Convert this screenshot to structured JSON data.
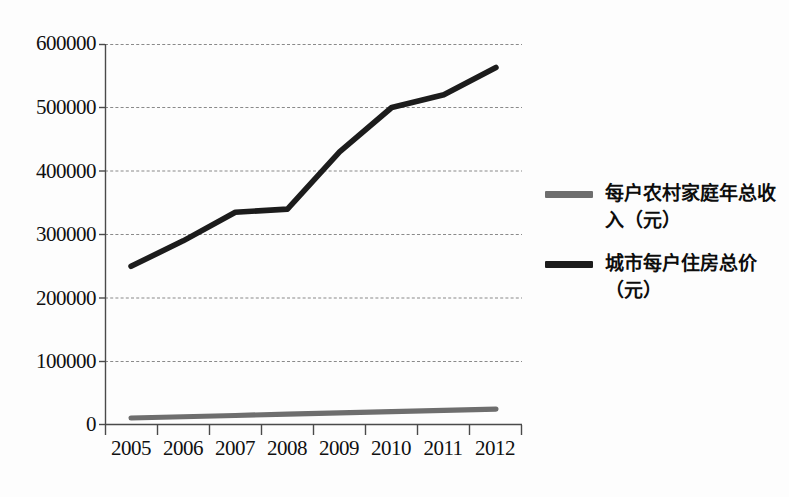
{
  "chart_data": {
    "type": "line",
    "title": "",
    "subtitle": "",
    "xlabel": "",
    "ylabel": "",
    "categories": [
      "2005",
      "2006",
      "2007",
      "2008",
      "2009",
      "2010",
      "2011",
      "2012"
    ],
    "x": [
      2005,
      2006,
      2007,
      2008,
      2009,
      2010,
      2011,
      2012
    ],
    "ylim": [
      0,
      600000
    ],
    "y_ticks": [
      0,
      100000,
      200000,
      300000,
      400000,
      500000,
      600000
    ],
    "y_tick_labels": [
      "0",
      "100000",
      "200000",
      "300000",
      "400000",
      "500000",
      "600000"
    ],
    "grid": "horizontal-dashed",
    "legend_position": "right",
    "series": [
      {
        "name": "每户农村家庭年总收入（元）",
        "color": "#6e6e6e",
        "values": [
          11000,
          13000,
          15000,
          17000,
          19000,
          21000,
          23000,
          25000
        ]
      },
      {
        "name": "城市每户住房总价（元）",
        "color": "#1c1c1c",
        "values": [
          250000,
          290000,
          335000,
          340000,
          430000,
          500000,
          520000,
          563000
        ]
      }
    ]
  },
  "legend": {
    "items": [
      {
        "label": "每户农村家庭年总收入（元）",
        "swatch_color": "#6e6e6e",
        "marker": "line-swatch"
      },
      {
        "label": "城市每户住房总价（元）",
        "swatch_color": "#1c1c1c",
        "marker": "line-swatch"
      }
    ]
  },
  "axes": {
    "y_tick_labels": [
      "600000",
      "500000",
      "400000",
      "300000",
      "200000",
      "100000",
      "0"
    ],
    "x_tick_labels": [
      "2005",
      "2006",
      "2007",
      "2008",
      "2009",
      "2010",
      "2011",
      "2012"
    ]
  },
  "colors": {
    "background": "#fdfdfd",
    "axis": "#4a4a4a",
    "gridline": "#8a8a8a",
    "series_rural_income": "#6e6e6e",
    "series_urban_housing": "#1c1c1c",
    "text": "#101010"
  }
}
